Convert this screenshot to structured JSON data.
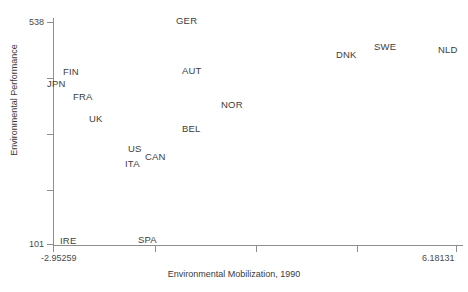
{
  "chart_data": {
    "type": "scatter",
    "title": "",
    "xlabel": "Environmental Mobilization, 1990",
    "ylabel": "Environmental Performance",
    "xlim": [
      -2.95259,
      6.18131
    ],
    "ylim": [
      101,
      538
    ],
    "grid": false,
    "legend": "none",
    "marker_style": "text-label-only",
    "xticklabels": [
      "-2.95259",
      "6.18131"
    ],
    "yticklabels": [
      "538",
      "101"
    ],
    "x_tick_count": 5,
    "y_tick_count": 5,
    "points": [
      {
        "label": "GER",
        "x": 0.15,
        "y": 525
      },
      {
        "label": "DNK",
        "x": 3.78,
        "y": 458
      },
      {
        "label": "SWE",
        "x": 4.62,
        "y": 472
      },
      {
        "label": "NLD",
        "x": 6.05,
        "y": 466
      },
      {
        "label": "FIN",
        "x": -2.7,
        "y": 430
      },
      {
        "label": "JPN",
        "x": -3.01,
        "y": 410
      },
      {
        "label": "AUT",
        "x": 0.28,
        "y": 424
      },
      {
        "label": "FRA",
        "x": -2.4,
        "y": 386
      },
      {
        "label": "NOR",
        "x": 1.1,
        "y": 357
      },
      {
        "label": "UK",
        "x": -2.06,
        "y": 341
      },
      {
        "label": "BEL",
        "x": 0.2,
        "y": 310
      },
      {
        "label": "US",
        "x": -1.15,
        "y": 271
      },
      {
        "label": "CAN",
        "x": -0.79,
        "y": 253
      },
      {
        "label": "ITA",
        "x": -1.13,
        "y": 243
      },
      {
        "label": "SPA",
        "x": -0.81,
        "y": 105
      },
      {
        "label": "IRE",
        "x": -2.64,
        "y": 101
      }
    ]
  },
  "axes": {
    "y_ticks": [
      {
        "label": "538",
        "px": 22
      },
      {
        "label": "",
        "px": 78
      },
      {
        "label": "",
        "px": 134
      },
      {
        "label": "",
        "px": 190
      },
      {
        "label": "101",
        "px": 244
      }
    ],
    "x_ticks": [
      {
        "label": "-2.95259",
        "px": 53
      },
      {
        "label": "",
        "px": 155
      },
      {
        "label": "",
        "px": 256
      },
      {
        "label": "",
        "px": 357
      },
      {
        "label": "6.18131",
        "px": 456
      }
    ]
  },
  "labels": {
    "x_title": "Environmental Mobilization, 1990",
    "y_title": "Environmental Performance",
    "x_min": "-2.95259",
    "x_max": "6.18131",
    "y_min": "101",
    "y_max": "538"
  },
  "colors": {
    "background": "#ffffff",
    "axis": "#8d8d8d",
    "text": "#3a3a3a"
  },
  "point_positions": [
    {
      "label": "GER",
      "left": 176,
      "top": 16
    },
    {
      "label": "SWE",
      "left": 374,
      "top": 42
    },
    {
      "label": "NLD",
      "left": 438,
      "top": 45
    },
    {
      "label": "DNK",
      "left": 336,
      "top": 50
    },
    {
      "label": "FIN",
      "left": 63,
      "top": 67
    },
    {
      "label": "JPN",
      "left": 47,
      "top": 79
    },
    {
      "label": "AUT",
      "left": 182,
      "top": 66
    },
    {
      "label": "FRA",
      "left": 73,
      "top": 92
    },
    {
      "label": "NOR",
      "left": 221,
      "top": 100
    },
    {
      "label": "UK",
      "left": 89,
      "top": 114
    },
    {
      "label": "BEL",
      "left": 182,
      "top": 124
    },
    {
      "label": "US",
      "left": 128,
      "top": 144
    },
    {
      "label": "CAN",
      "left": 145,
      "top": 152
    },
    {
      "label": "ITA",
      "left": 125,
      "top": 159
    },
    {
      "label": "SPA",
      "left": 138,
      "top": 235
    },
    {
      "label": "IRE",
      "left": 60,
      "top": 236
    }
  ]
}
